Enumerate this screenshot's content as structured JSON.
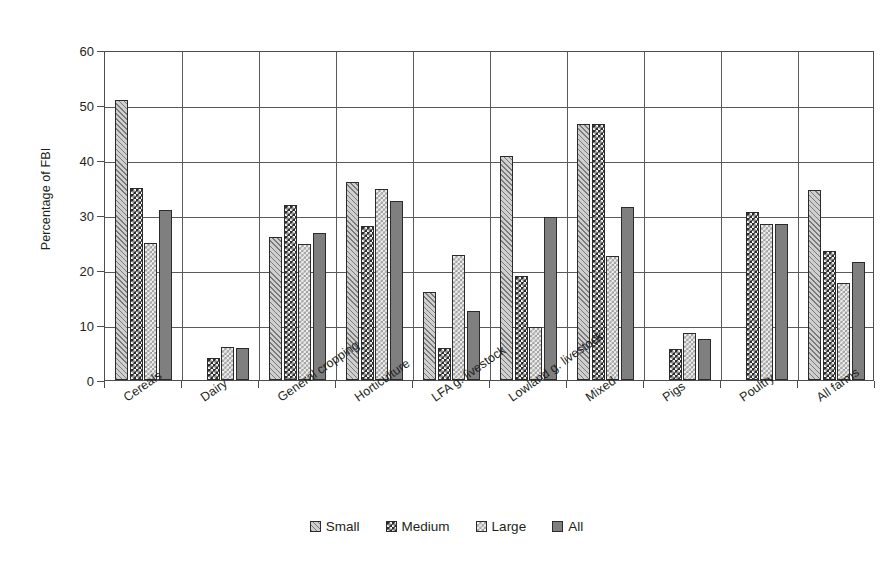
{
  "chart_data": {
    "type": "bar",
    "title": "",
    "xlabel": "",
    "ylabel": "Percentage of FBI",
    "ylim": [
      0,
      60
    ],
    "ytick_step": 10,
    "yticks": [
      0,
      10,
      20,
      30,
      40,
      50,
      60
    ],
    "grid": "horizontal-and-vertical",
    "legend_position": "bottom-center",
    "categories": [
      "Cereals",
      "Dairy",
      "General cropping",
      "Horticulture",
      "LFA g. livestock",
      "Lowland g. livestock",
      "Mixed",
      "Pigs",
      "Poultry",
      "All farms"
    ],
    "series": [
      {
        "name": "Small",
        "pattern": "diagonal-hatch",
        "values": [
          51.0,
          null,
          26.0,
          36.0,
          16.0,
          40.8,
          46.6,
          null,
          null,
          34.6
        ]
      },
      {
        "name": "Medium",
        "pattern": "dark-checker",
        "values": [
          35.0,
          4.0,
          31.9,
          28.0,
          5.8,
          18.9,
          46.6,
          5.6,
          30.6,
          23.5
        ]
      },
      {
        "name": "Large",
        "pattern": "light-dotted-checker",
        "values": [
          24.9,
          6.0,
          24.8,
          34.8,
          22.7,
          9.6,
          22.5,
          8.6,
          28.4,
          17.6
        ]
      },
      {
        "name": "All",
        "pattern": "solid-gray",
        "values": [
          30.9,
          5.8,
          26.8,
          32.5,
          12.5,
          29.6,
          31.5,
          7.4,
          28.3,
          21.4
        ]
      }
    ]
  },
  "colors": {
    "small": "#cfcfcf",
    "medium": "#2e2e2e",
    "large": "#eeeeee",
    "all": "#7f7f7f",
    "axis": "#4d4d4d",
    "grid": "#5a5a5a",
    "text": "#231f20",
    "background": "#ffffff"
  },
  "legend": {
    "items": [
      {
        "label": "Small"
      },
      {
        "label": "Medium"
      },
      {
        "label": "Large"
      },
      {
        "label": "All"
      }
    ]
  }
}
